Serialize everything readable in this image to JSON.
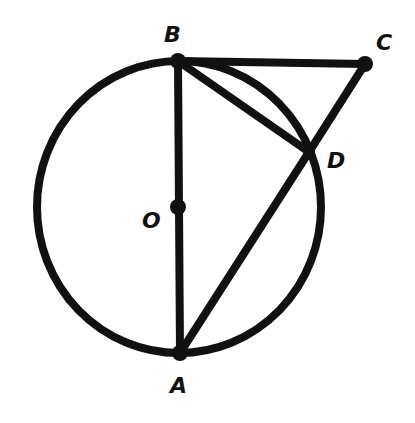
{
  "diagram": {
    "type": "geometry",
    "stroke_color": "#111111",
    "background": "#ffffff",
    "circle": {
      "center": "O",
      "cx": 179,
      "cy": 207,
      "rx": 142,
      "ry": 146
    },
    "points": {
      "B": {
        "x": 178,
        "y": 61,
        "label": "B",
        "lx": 164,
        "ly": 42
      },
      "C": {
        "x": 365,
        "y": 64,
        "label": "C",
        "lx": 376,
        "ly": 50
      },
      "D": {
        "x": 309,
        "y": 152,
        "label": "D",
        "lx": 327,
        "ly": 168
      },
      "O": {
        "x": 178,
        "y": 207,
        "label": "O",
        "lx": 142,
        "ly": 228
      },
      "A": {
        "x": 180,
        "y": 353,
        "label": "A",
        "lx": 170,
        "ly": 393
      }
    },
    "segments": [
      [
        "B",
        "C"
      ],
      [
        "C",
        "D"
      ],
      [
        "D",
        "A"
      ],
      [
        "B",
        "D"
      ],
      [
        "B",
        "A"
      ]
    ]
  }
}
